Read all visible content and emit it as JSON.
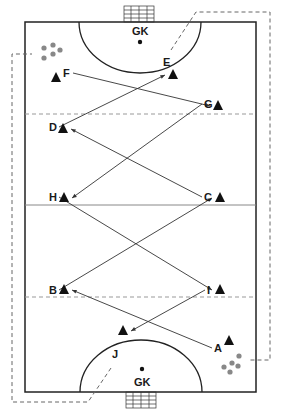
{
  "colors": {
    "line": "#222222",
    "dash": "#777777",
    "ball": "#888888",
    "cone": "#111111"
  },
  "goalkeepers": {
    "top": "GK",
    "bottom": "GK"
  },
  "players": [
    {
      "id": "F",
      "label": "F",
      "x": 63,
      "y": 77,
      "cx": 56,
      "cy": 78
    },
    {
      "id": "E",
      "label": "E",
      "x": 163,
      "y": 66,
      "cx": 173,
      "cy": 75
    },
    {
      "id": "G",
      "label": "G",
      "x": 204,
      "y": 108,
      "cx": 218,
      "cy": 106
    },
    {
      "id": "D",
      "label": "D",
      "x": 49,
      "y": 131,
      "cx": 63,
      "cy": 129
    },
    {
      "id": "H",
      "label": "H",
      "x": 49,
      "y": 201,
      "cx": 64,
      "cy": 198
    },
    {
      "id": "C",
      "label": "C",
      "x": 204,
      "y": 201,
      "cx": 220,
      "cy": 198
    },
    {
      "id": "B",
      "label": "B",
      "x": 49,
      "y": 294,
      "cx": 64,
      "cy": 290
    },
    {
      "id": "I",
      "label": "I",
      "x": 207,
      "y": 294,
      "cx": 220,
      "cy": 290
    },
    {
      "id": "A",
      "label": "A",
      "x": 214,
      "y": 352,
      "cx": 229,
      "cy": 341
    },
    {
      "id": "J",
      "label": "J",
      "x": 112,
      "y": 358,
      "cx": 123,
      "cy": 331
    }
  ],
  "passes": [
    [
      "A",
      "B"
    ],
    [
      "B",
      "C"
    ],
    [
      "C",
      "D"
    ],
    [
      "D",
      "E"
    ],
    [
      "F",
      "G"
    ],
    [
      "G",
      "H"
    ],
    [
      "H",
      "I"
    ],
    [
      "I",
      "J"
    ]
  ]
}
